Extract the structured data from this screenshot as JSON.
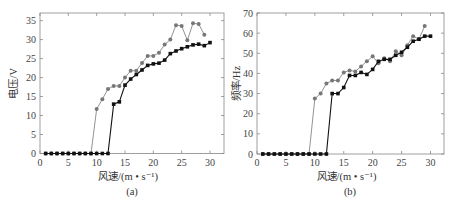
{
  "chart_data": [
    {
      "type": "line",
      "panel_label": "(a)",
      "title": "",
      "xlabel": "风速/(m • s⁻¹)",
      "ylabel": "电压/V",
      "xlim": [
        0,
        32.5
      ],
      "ylim": [
        0,
        37
      ],
      "xticks": [
        0,
        5,
        10,
        15,
        20,
        25,
        30
      ],
      "yticks": [
        0,
        5,
        10,
        15,
        20,
        25,
        30,
        35
      ],
      "grid": false,
      "legend": null,
      "series": [
        {
          "name": "series-gray-circle",
          "color": "#777777",
          "marker": "circle",
          "x": [
            1,
            2,
            3,
            4,
            5,
            6,
            7,
            8,
            9,
            10,
            11,
            12,
            13,
            14,
            15,
            16,
            17,
            18,
            19,
            20,
            21,
            22,
            23,
            24,
            25,
            26,
            27,
            28,
            29
          ],
          "values": [
            0,
            0,
            0,
            0,
            0,
            0,
            0,
            0,
            0,
            11.7,
            14.3,
            17,
            17.8,
            17.8,
            20,
            21.8,
            21.8,
            23.8,
            25.7,
            25.7,
            26.5,
            28.7,
            30,
            33.8,
            33.6,
            29.8,
            34.3,
            34.1,
            31.3
          ]
        },
        {
          "name": "series-black-square",
          "color": "#111111",
          "marker": "square",
          "x": [
            1,
            2,
            3,
            4,
            5,
            6,
            7,
            8,
            9,
            10,
            11,
            12,
            13,
            14,
            15,
            16,
            17,
            18,
            19,
            20,
            21,
            22,
            23,
            24,
            25,
            26,
            27,
            28,
            29,
            30
          ],
          "values": [
            0,
            0,
            0,
            0,
            0,
            0,
            0,
            0,
            0,
            0,
            0,
            0,
            13,
            13.6,
            18,
            19.6,
            20.8,
            22,
            23.2,
            23.6,
            23.8,
            24.6,
            26.3,
            27,
            27.6,
            28.1,
            28.6,
            28.8,
            28.4,
            29.2
          ]
        }
      ]
    },
    {
      "type": "line",
      "panel_label": "(b)",
      "title": "",
      "xlabel": "风速/(m • s⁻¹)",
      "ylabel": "频率/Hz",
      "xlim": [
        0,
        32.5
      ],
      "ylim": [
        0,
        70
      ],
      "xticks": [
        0,
        5,
        10,
        15,
        20,
        25,
        30
      ],
      "yticks": [
        0,
        10,
        20,
        30,
        40,
        50,
        60,
        70
      ],
      "grid": false,
      "legend": null,
      "series": [
        {
          "name": "series-gray-circle",
          "color": "#777777",
          "marker": "circle",
          "x": [
            1,
            2,
            3,
            4,
            5,
            6,
            7,
            8,
            9,
            10,
            11,
            12,
            13,
            14,
            15,
            16,
            17,
            18,
            19,
            20,
            21,
            22,
            23,
            24,
            25,
            26,
            27,
            28,
            29
          ],
          "values": [
            0,
            0,
            0,
            0,
            0,
            0,
            0,
            0,
            0,
            27.5,
            30,
            35,
            36.5,
            36.5,
            40.5,
            41.5,
            41,
            43.5,
            46,
            48.5,
            45,
            47.5,
            46,
            51,
            49,
            54,
            58.5,
            57,
            63.5
          ]
        },
        {
          "name": "series-black-square",
          "color": "#111111",
          "marker": "square",
          "x": [
            1,
            2,
            3,
            4,
            5,
            6,
            7,
            8,
            9,
            10,
            11,
            12,
            13,
            14,
            15,
            16,
            17,
            18,
            19,
            20,
            21,
            22,
            23,
            24,
            25,
            26,
            27,
            28,
            29,
            30
          ],
          "values": [
            0,
            0,
            0,
            0,
            0,
            0,
            0,
            0,
            0,
            0,
            0,
            0,
            30,
            30,
            33,
            39,
            39,
            40.5,
            39.5,
            42,
            46,
            47,
            47,
            49,
            50.5,
            53,
            56,
            57,
            58.5,
            58.5
          ]
        }
      ]
    }
  ]
}
